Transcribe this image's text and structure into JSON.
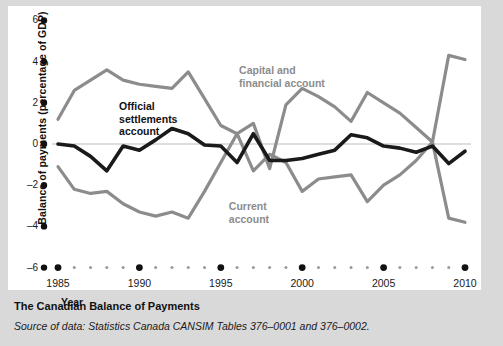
{
  "figure": {
    "caption_title": "The Canadian Balance of Payments",
    "caption_source": "Source of data: Statistics Canada CANSIM Tables 376–0001 and 376–0002.",
    "background_color": "#d9d9d9",
    "card_color": "#ffffff"
  },
  "labels": {
    "capital": "Capital and\nfinancial account",
    "capital_line1": "Capital and",
    "capital_line2": "financial account",
    "official_line1": "Official",
    "official_line2": "settlements",
    "official_line3": "account",
    "current_line1": "Current",
    "current_line2": "account",
    "xaxis_title": "Year",
    "yaxis_title": "Balance of payments (percentage of GDP)"
  },
  "chart_data": {
    "type": "line",
    "title": "The Canadian Balance of Payments",
    "xlabel": "Year",
    "ylabel": "Balance of payments (percentage of GDP)",
    "xlim": [
      1985,
      2010
    ],
    "ylim": [
      -6,
      6
    ],
    "yticks": [
      6,
      4,
      2,
      0,
      -2,
      -4,
      -6
    ],
    "ytick_labels": [
      "6",
      "4",
      "2",
      "0",
      "–2",
      "–4",
      "–6"
    ],
    "xticks": [
      1985,
      1990,
      1995,
      2000,
      2005,
      2010
    ],
    "xtick_labels": [
      "1985",
      "1990",
      "1995",
      "2000",
      "2005",
      "2010"
    ],
    "minor_xticks": [
      1986,
      1987,
      1988,
      1989,
      1991,
      1992,
      1993,
      1994,
      1996,
      1997,
      1998,
      1999,
      2001,
      2002,
      2003,
      2004,
      2006,
      2007,
      2008,
      2009
    ],
    "grid": false,
    "zero_line": true,
    "legend_position": "inline-annotations",
    "x": [
      1985,
      1986,
      1987,
      1988,
      1989,
      1990,
      1991,
      1992,
      1993,
      1994,
      1995,
      1996,
      1997,
      1998,
      1999,
      2000,
      2001,
      2002,
      2003,
      2004,
      2005,
      2006,
      2007,
      2008,
      2009,
      2010
    ],
    "series": [
      {
        "name": "Capital and financial account",
        "color": "#8c8c8c",
        "values": [
          1.2,
          2.6,
          3.1,
          3.6,
          3.1,
          2.9,
          2.8,
          2.7,
          3.5,
          2.2,
          0.9,
          0.5,
          -1.3,
          -0.5,
          -0.9,
          -2.3,
          -1.7,
          -1.6,
          -1.5,
          -2.8,
          -2.0,
          -1.5,
          -0.8,
          0.1,
          -3.6,
          -3.8
        ]
      },
      {
        "name": "Current account",
        "color": "#8c8c8c",
        "values": [
          -1.1,
          -2.2,
          -2.4,
          -2.3,
          -2.9,
          -3.3,
          -3.5,
          -3.3,
          -3.6,
          -2.3,
          -0.9,
          0.5,
          1.0,
          -1.2,
          1.9,
          2.7,
          2.3,
          1.8,
          1.1,
          2.5,
          2.0,
          1.5,
          0.8,
          0.1,
          4.3,
          4.1
        ]
      },
      {
        "name": "Official settlements account",
        "color": "#1a1a1a",
        "values": [
          0.0,
          -0.1,
          -0.6,
          -1.3,
          -0.1,
          -0.3,
          0.2,
          0.75,
          0.5,
          -0.05,
          -0.1,
          -0.9,
          0.5,
          -0.8,
          -0.8,
          -0.7,
          -0.5,
          -0.3,
          0.45,
          0.3,
          -0.1,
          -0.2,
          -0.4,
          -0.1,
          -0.95,
          -0.35
        ]
      }
    ]
  },
  "plot_geometry": {
    "x0": 50,
    "x1": 457,
    "y_zero": 138,
    "px_per_unit": 20.6
  }
}
